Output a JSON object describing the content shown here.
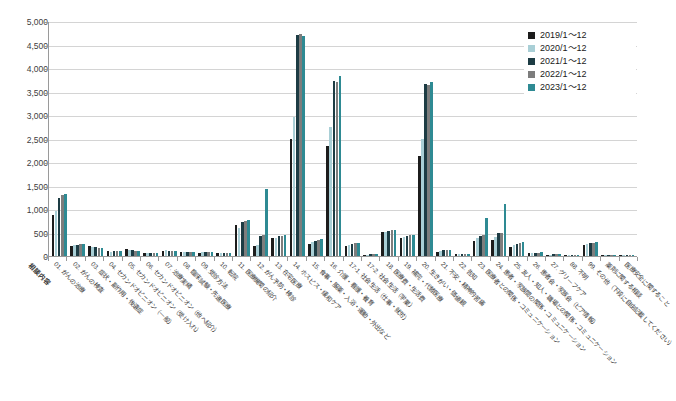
{
  "chart_data": {
    "type": "bar",
    "title": "",
    "xlabel": "相談内容",
    "ylabel": "",
    "ylim": [
      0,
      5000
    ],
    "ytick_step": 500,
    "grid": true,
    "legend_position": "top-right",
    "ytick_labels": [
      "5,000",
      "4,500",
      "4,000",
      "3,500",
      "3,000",
      "2,500",
      "2,000",
      "1,500",
      "1,000",
      "500",
      "0"
    ],
    "categories": [
      "01. がんの治療",
      "02. がんの検査",
      "03. 症状・副作用・後遺症",
      "04. セカンドオピニオン（一般）",
      "05. セカンドオピニオン（受け入れ）",
      "06. セカンドオピニオン（他へ紹介）",
      "07. 治療実績",
      "08. 臨床試験・先進医療",
      "09. 受診方法",
      "10. 転院",
      "11. 医療機関の紹介",
      "12. がん予防・検診",
      "13. 在宅医療",
      "14. ホスピス・緩和ケア",
      "15. 食事・服薬・入浴・運動・外出など",
      "16. 介護・看護・養育",
      "17-1. 社会生活（仕事・就労）",
      "17-2. 社会生活（学業）",
      "18. 医療費・生活費",
      "19. 補完・代替医療",
      "20. 生きがい・価値観",
      "21. 不安・精神的苦痛",
      "22. 告知",
      "23. 医療者との関係・コミュニケーション",
      "24. 患者・家族間の関係・コミュニケーション",
      "25. 友人・知人・職場との関係・コミュニケーション",
      "26. 患者会・家族会（ピア情報）",
      "27. グリーフケア",
      "88. 不明",
      "99. その他（下段に自由記載してください）",
      "薬剤に関する相談",
      "医療安全に関すること"
    ],
    "series": [
      {
        "name": "2019/1～12",
        "color": "#1c1c1c",
        "values": [
          880,
          215,
          205,
          100,
          140,
          70,
          115,
          90,
          70,
          55,
          650,
          220,
          380,
          2500,
          265,
          2350,
          215,
          25,
          510,
          385,
          2130,
          95,
          35,
          330,
          350,
          200,
          55,
          25,
          20,
          230,
          15,
          15
        ]
      },
      {
        "name": "2020/1～12",
        "color": "#a9cfd6",
        "values": [
          960,
          230,
          190,
          95,
          130,
          65,
          120,
          85,
          75,
          60,
          600,
          240,
          390,
          2950,
          300,
          2750,
          235,
          30,
          520,
          400,
          2480,
          110,
          40,
          380,
          400,
          230,
          60,
          30,
          25,
          250,
          18,
          18
        ]
      },
      {
        "name": "2021/1～12",
        "color": "#1d3c44",
        "values": [
          1230,
          245,
          185,
          105,
          120,
          60,
          110,
          80,
          80,
          65,
          720,
          430,
          420,
          4700,
          330,
          3730,
          260,
          35,
          540,
          430,
          3660,
          120,
          45,
          420,
          480,
          260,
          70,
          35,
          25,
          275,
          20,
          20
        ]
      },
      {
        "name": "2022/1～12",
        "color": "#7d7d7d",
        "values": [
          1300,
          250,
          180,
          100,
          115,
          58,
          105,
          78,
          78,
          62,
          740,
          450,
          430,
          4720,
          345,
          3710,
          270,
          38,
          545,
          440,
          3640,
          125,
          48,
          440,
          500,
          270,
          72,
          36,
          26,
          280,
          21,
          21
        ]
      },
      {
        "name": "2023/1～12",
        "color": "#2e8a93"
      }
    ],
    "series_2023_values": [
      1330,
      255,
      175,
      98,
      110,
      55,
      100,
      75,
      82,
      68,
      760,
      1430,
      450,
      4680,
      360,
      3840,
      285,
      40,
      555,
      450,
      3700,
      130,
      50,
      800,
      1100,
      300,
      80,
      40,
      28,
      300,
      22,
      22
    ]
  },
  "legend": {
    "items": [
      {
        "label": "2019/1～12",
        "color": "#1c1c1c"
      },
      {
        "label": "2020/1～12",
        "color": "#a9cfd6"
      },
      {
        "label": "2021/1～12",
        "color": "#1d3c44"
      },
      {
        "label": "2022/1～12",
        "color": "#7d7d7d"
      },
      {
        "label": "2023/1～12",
        "color": "#2e8a93"
      }
    ]
  }
}
